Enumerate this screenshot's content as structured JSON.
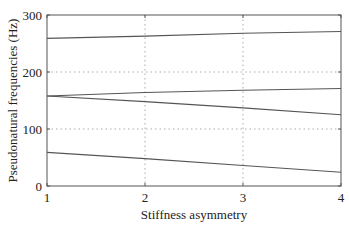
{
  "chart_data": {
    "type": "line",
    "title": "",
    "xlabel": "Stiffness asymmetry",
    "ylabel": "Pseudonatural frequencies (Hz)",
    "xlim": [
      1,
      4
    ],
    "ylim": [
      0,
      300
    ],
    "xticks": [
      "1",
      "2",
      "3",
      "4"
    ],
    "yticks": [
      "0",
      "100",
      "200",
      "300"
    ],
    "grid": true,
    "legend": null,
    "x": [
      1,
      2,
      3,
      4
    ],
    "series": [
      {
        "name": "mode 1",
        "values": [
          59,
          48,
          36,
          24
        ]
      },
      {
        "name": "mode 2",
        "values": [
          158,
          148,
          137,
          125
        ]
      },
      {
        "name": "mode 3",
        "values": [
          158,
          164,
          168,
          171
        ]
      },
      {
        "name": "mode 4",
        "values": [
          259,
          263,
          268,
          271
        ]
      }
    ],
    "line_color": "#555555"
  }
}
